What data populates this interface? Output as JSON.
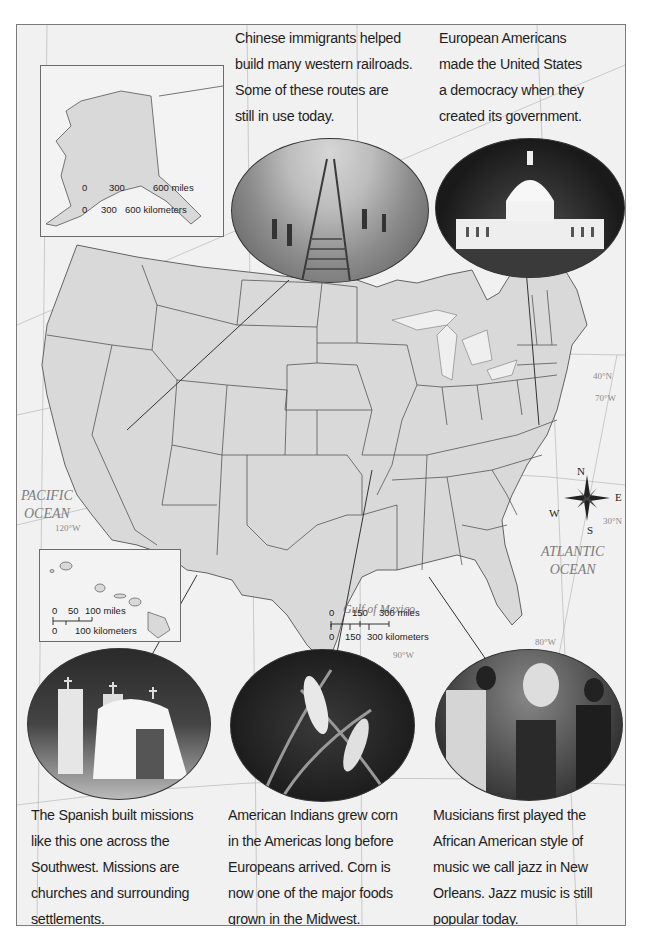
{
  "captions": {
    "railroad": [
      "Chinese immigrants helped",
      "build many western railroads.",
      "Some of these routes are",
      "still in use today."
    ],
    "capitol": [
      "European Americans",
      "made the United States",
      "a democracy when they",
      "created its government."
    ],
    "missions": [
      "The Spanish built missions",
      "like this one across the",
      "Southwest. Missions are",
      "churches and surrounding",
      "settlements."
    ],
    "corn": [
      "American Indians grew corn",
      "in the Americas long before",
      "Europeans arrived. Corn is",
      "now one of the major foods",
      "grown in the Midwest."
    ],
    "jazz": [
      "Musicians first played the",
      "African American style of",
      "music we call jazz in New",
      "Orleans. Jazz music is still",
      "popular today."
    ]
  },
  "photos": {
    "railroad": "railroad-construction-photo",
    "capitol": "us-capitol-photo",
    "missions": "spanish-mission-photo",
    "corn": "corn-plants-photo",
    "jazz": "jazz-musicians-photo"
  },
  "labels": {
    "pacific": [
      "PACIFIC",
      "OCEAN"
    ],
    "atlantic": [
      "ATLANTIC",
      "OCEAN"
    ],
    "gulf": "Gulf of Mexico",
    "lon_120": "120°W",
    "lon_90": "90°W",
    "lon_80": "80°W",
    "lon_70": "70°W",
    "lat_40": "40°N",
    "lat_30": "30°N"
  },
  "alaska_scale": {
    "miles": [
      "0",
      "300",
      "600 miles"
    ],
    "km": [
      "0",
      "300",
      "600 kilometers"
    ]
  },
  "hawaii_scale": {
    "miles": [
      "0",
      "50",
      "100 miles"
    ],
    "km": [
      "0",
      "100 kilometers"
    ]
  },
  "main_scale": {
    "miles": [
      "0",
      "150",
      "300 miles"
    ],
    "km": [
      "0",
      "150",
      "300 kilometers"
    ]
  },
  "compass": {
    "n": "N",
    "s": "S",
    "e": "E",
    "w": "W"
  }
}
